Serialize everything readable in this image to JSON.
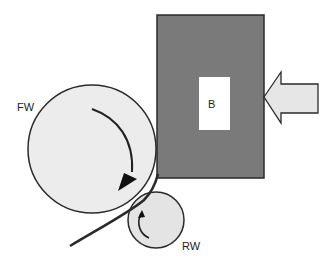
{
  "diagram": {
    "labels": {
      "front_wheel": "FW",
      "rear_wheel": "RW",
      "block": "B"
    },
    "colors": {
      "block_fill": "#7a7a7a",
      "wheel_fill": "#e8e8e8",
      "arrow_fill": "#e6e6e6",
      "stroke": "#2a2a2a",
      "inner_rect": "#ffffff"
    }
  }
}
